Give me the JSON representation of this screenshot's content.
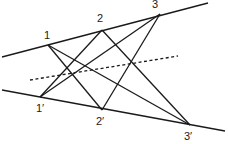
{
  "diagram": {
    "type": "projective-geometry (Pappus configuration)",
    "points": {
      "p1": {
        "label": "1",
        "x": 48,
        "y": 45
      },
      "p2": {
        "label": "2",
        "x": 102,
        "y": 30
      },
      "p3": {
        "label": "3",
        "x": 160,
        "y": 14
      },
      "q1": {
        "label": "1′",
        "x": 40,
        "y": 97
      },
      "q2": {
        "label": "2′",
        "x": 102,
        "y": 110
      },
      "q3": {
        "label": "3′",
        "x": 190,
        "y": 125
      }
    },
    "lines": {
      "top": {
        "x1": 2,
        "y1": 57,
        "x2": 208,
        "y2": 3
      },
      "bottom": {
        "x1": 2,
        "y1": 90,
        "x2": 225,
        "y2": 131
      },
      "dotted": {
        "x1": 30,
        "y1": 80,
        "x2": 178,
        "y2": 56
      }
    },
    "colors": {
      "stroke": "#1a1a1a",
      "background": "#ffffff"
    }
  }
}
